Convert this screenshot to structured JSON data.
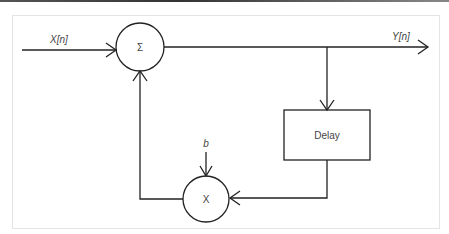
{
  "diagram": {
    "type": "signal-flow-block-diagram",
    "input_label": "X[n]",
    "output_label": "Y[n]",
    "summer": {
      "symbol": "Σ"
    },
    "multiplier": {
      "symbol": "X"
    },
    "coefficient_label": "b",
    "delay_block": {
      "label": "Delay"
    },
    "colors": {
      "stroke": "#222222",
      "text": "#444444",
      "frame": "#e4e4e4"
    }
  }
}
